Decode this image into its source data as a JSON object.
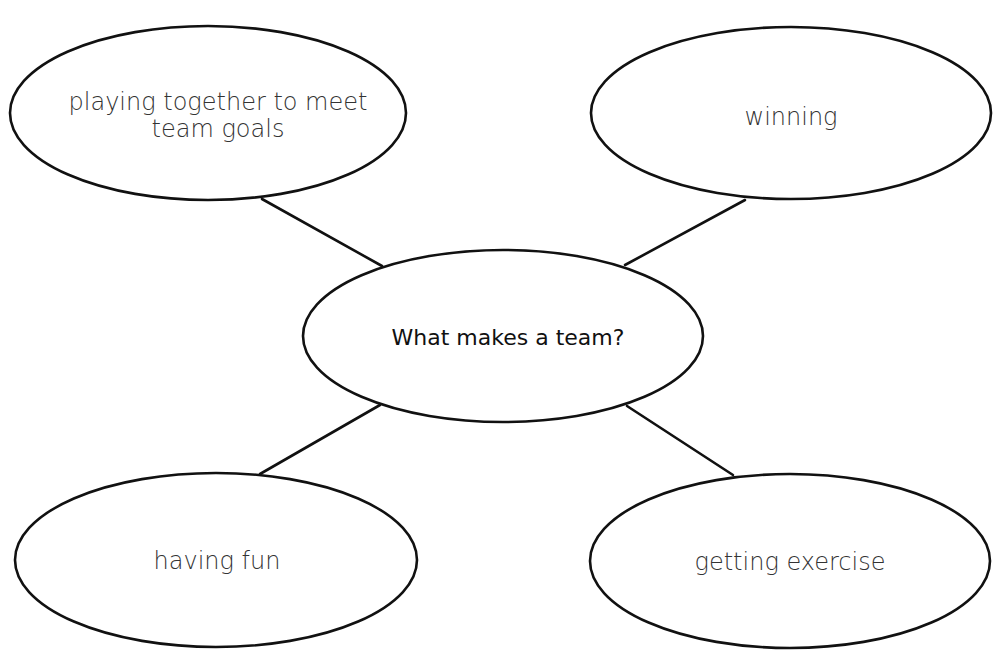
{
  "diagram": {
    "type": "concept-map",
    "center": {
      "label": "What makes a team?"
    },
    "nodes": [
      {
        "position": "top-left",
        "lines": [
          "playing together to meet",
          "team goals"
        ]
      },
      {
        "position": "top-right",
        "lines": [
          "winning"
        ]
      },
      {
        "position": "bottom-left",
        "lines": [
          "having fun"
        ]
      },
      {
        "position": "bottom-right",
        "lines": [
          "getting exercise"
        ]
      }
    ],
    "colors": {
      "stroke": "#111111",
      "text": "#333333",
      "background": "#ffffff"
    }
  }
}
